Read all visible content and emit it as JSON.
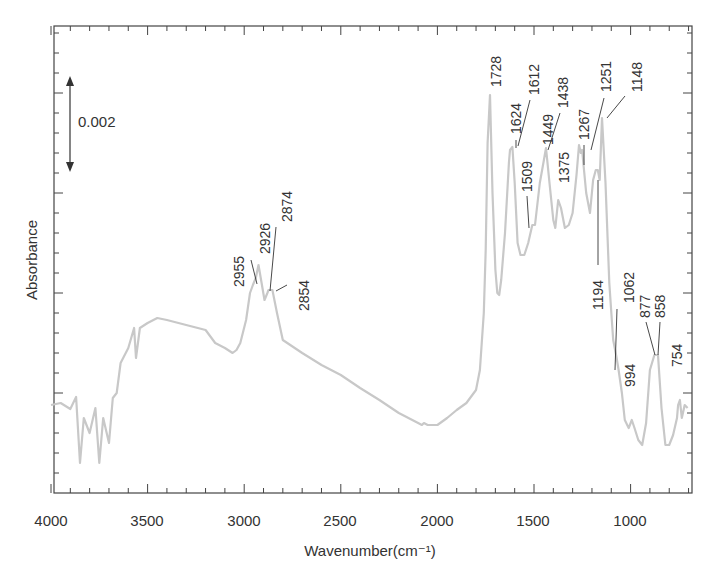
{
  "chart_data": {
    "type": "line",
    "title": "",
    "xlabel": "Wavenumber(cm⁻¹)",
    "ylabel": "Absorbance",
    "xlim": [
      4000,
      700
    ],
    "x_reversed": true,
    "xticks": [
      4000,
      3500,
      3000,
      2500,
      2000,
      1500,
      1000
    ],
    "x_minor_step": 100,
    "y_tick_labels_shown": false,
    "ylim": [
      0,
      0.00934
    ],
    "y_major_step": 0.002,
    "scale_bar": {
      "label": "0.002",
      "value": 0.002
    },
    "grid": false,
    "legend": null,
    "line_color": "#c8c8c8",
    "series": [
      {
        "name": "IR spectrum",
        "x": [
          4000,
          3950,
          3900,
          3870,
          3850,
          3830,
          3800,
          3770,
          3750,
          3730,
          3700,
          3680,
          3660,
          3640,
          3600,
          3570,
          3560,
          3540,
          3500,
          3450,
          3400,
          3300,
          3200,
          3150,
          3100,
          3060,
          3040,
          3020,
          2990,
          2970,
          2955,
          2940,
          2926,
          2910,
          2895,
          2880,
          2874,
          2854,
          2830,
          2800,
          2700,
          2600,
          2500,
          2400,
          2300,
          2200,
          2100,
          2080,
          2070,
          2050,
          2000,
          1950,
          1900,
          1850,
          1800,
          1780,
          1760,
          1750,
          1740,
          1728,
          1715,
          1700,
          1690,
          1680,
          1670,
          1650,
          1630,
          1624,
          1612,
          1600,
          1585,
          1570,
          1550,
          1530,
          1509,
          1495,
          1470,
          1449,
          1438,
          1420,
          1400,
          1390,
          1375,
          1360,
          1340,
          1320,
          1300,
          1280,
          1267,
          1258,
          1251,
          1230,
          1210,
          1194,
          1180,
          1170,
          1160,
          1148,
          1130,
          1110,
          1090,
          1075,
          1062,
          1045,
          1030,
          1010,
          994,
          980,
          960,
          940,
          920,
          900,
          877,
          858,
          840,
          820,
          800,
          780,
          760,
          754,
          745,
          735,
          720,
          705
        ],
        "y": [
          0.00176,
          0.0018,
          0.00168,
          0.00192,
          0.0006,
          0.0015,
          0.0012,
          0.0017,
          0.0006,
          0.0015,
          0.001,
          0.0019,
          0.002,
          0.0026,
          0.0029,
          0.0033,
          0.0027,
          0.0033,
          0.0034,
          0.0035,
          0.00346,
          0.00336,
          0.00326,
          0.003,
          0.0029,
          0.0028,
          0.00286,
          0.003,
          0.00346,
          0.004,
          0.00416,
          0.0043,
          0.00456,
          0.0042,
          0.00386,
          0.004,
          0.00406,
          0.00406,
          0.0036,
          0.00306,
          0.0028,
          0.00256,
          0.00236,
          0.0021,
          0.00186,
          0.0016,
          0.0014,
          0.00136,
          0.0014,
          0.00136,
          0.00136,
          0.0015,
          0.00166,
          0.0018,
          0.00206,
          0.00246,
          0.0036,
          0.00486,
          0.007,
          0.00796,
          0.006,
          0.00446,
          0.004,
          0.00396,
          0.00426,
          0.0052,
          0.0066,
          0.00686,
          0.00692,
          0.0062,
          0.005,
          0.00476,
          0.00476,
          0.005,
          0.00536,
          0.00536,
          0.0062,
          0.00666,
          0.0069,
          0.0062,
          0.00546,
          0.0053,
          0.00586,
          0.0057,
          0.0053,
          0.00536,
          0.0056,
          0.00636,
          0.00696,
          0.0068,
          0.00686,
          0.006,
          0.0056,
          0.00626,
          0.00646,
          0.00646,
          0.00626,
          0.0075,
          0.0062,
          0.0042,
          0.00306,
          0.00276,
          0.00246,
          0.002,
          0.00146,
          0.0013,
          0.00146,
          0.0013,
          0.00106,
          0.00096,
          0.0014,
          0.00246,
          0.00276,
          0.00276,
          0.0017,
          0.00096,
          0.00096,
          0.00116,
          0.0015,
          0.00176,
          0.00186,
          0.0015,
          0.00176,
          0.0017
        ]
      }
    ],
    "annotations": [
      {
        "label": "2955",
        "x": 2955
      },
      {
        "label": "2926",
        "x": 2926
      },
      {
        "label": "2874",
        "x": 2874
      },
      {
        "label": "2854",
        "x": 2854
      },
      {
        "label": "1728",
        "x": 1728
      },
      {
        "label": "1624",
        "x": 1624
      },
      {
        "label": "1612",
        "x": 1612
      },
      {
        "label": "1509",
        "x": 1509
      },
      {
        "label": "1449",
        "x": 1449
      },
      {
        "label": "1438",
        "x": 1438
      },
      {
        "label": "1375",
        "x": 1375
      },
      {
        "label": "1267",
        "x": 1267
      },
      {
        "label": "1251",
        "x": 1251
      },
      {
        "label": "1194",
        "x": 1194
      },
      {
        "label": "1148",
        "x": 1148
      },
      {
        "label": "1062",
        "x": 1062
      },
      {
        "label": "994",
        "x": 994
      },
      {
        "label": "877",
        "x": 877
      },
      {
        "label": "858",
        "x": 858
      },
      {
        "label": "754",
        "x": 754
      }
    ]
  },
  "labels": {
    "xlabel": "Wavenumber(cm⁻¹)",
    "ylabel": "Absorbance",
    "scale_bar": "0.002",
    "xticks": [
      "4000",
      "3500",
      "3000",
      "2500",
      "2000",
      "1500",
      "1000"
    ],
    "peaks": {
      "p2955": "2955",
      "p2926": "2926",
      "p2874": "2874",
      "p2854": "2854",
      "p1728": "1728",
      "p1624": "1624",
      "p1612": "1612",
      "p1509": "1509",
      "p1449": "1449",
      "p1438": "1438",
      "p1375": "1375",
      "p1267": "1267",
      "p1251": "1251",
      "p1194": "1194",
      "p1148": "1148",
      "p1062": "1062",
      "p994": "994",
      "p877": "877",
      "p858": "858",
      "p754": "754"
    }
  }
}
